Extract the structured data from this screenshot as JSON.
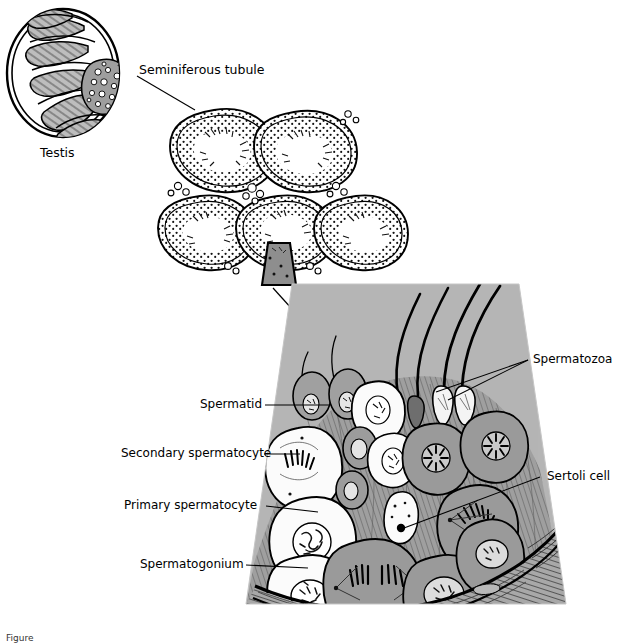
{
  "figure": {
    "domain": "biology-anatomy-diagram",
    "title_caption": "Figure",
    "background_color": "#ffffff",
    "ink_color": "#000000",
    "lumen_gray": "#b5b5b5",
    "cytoplasm_gray": "#9a9a9a",
    "pale_cell": "#f2f2f2"
  },
  "panels": {
    "testis": {
      "name": "testis-cross-section",
      "label": "Testis"
    },
    "tubule_cluster": {
      "name": "seminiferous-tubule-cluster",
      "label": "Seminiferous tubule",
      "tubule_count": 5,
      "wedge_marker": "magnified-region-wedge"
    },
    "magnified": {
      "name": "seminiferous-epithelium-wedge",
      "lumen_label": "lumen"
    }
  },
  "labels": {
    "testis": "Testis",
    "seminiferous_tubule": "Seminiferous tubule",
    "spermatid": "Spermatid",
    "secondary_spermatocyte": "Secondary spermatocyte",
    "primary_spermatocyte": "Primary spermatocyte",
    "spermatogonium": "Spermatogonium",
    "spermatozoa": "Spermatozoa",
    "sertoli_cell": "Sertoli cell"
  },
  "cell_types": [
    {
      "id": "spermatozoa",
      "label": "Spermatozoa",
      "side": "right",
      "stage": 5
    },
    {
      "id": "spermatid",
      "label": "Spermatid",
      "side": "left",
      "stage": 4
    },
    {
      "id": "secondary-spermatocyte",
      "label": "Secondary spermatocyte",
      "side": "left",
      "stage": 3
    },
    {
      "id": "primary-spermatocyte",
      "label": "Primary spermatocyte",
      "side": "left",
      "stage": 2
    },
    {
      "id": "spermatogonium",
      "label": "Spermatogonium",
      "side": "left",
      "stage": 1
    },
    {
      "id": "sertoli-cell",
      "label": "Sertoli cell",
      "side": "right",
      "stage": 0
    }
  ]
}
